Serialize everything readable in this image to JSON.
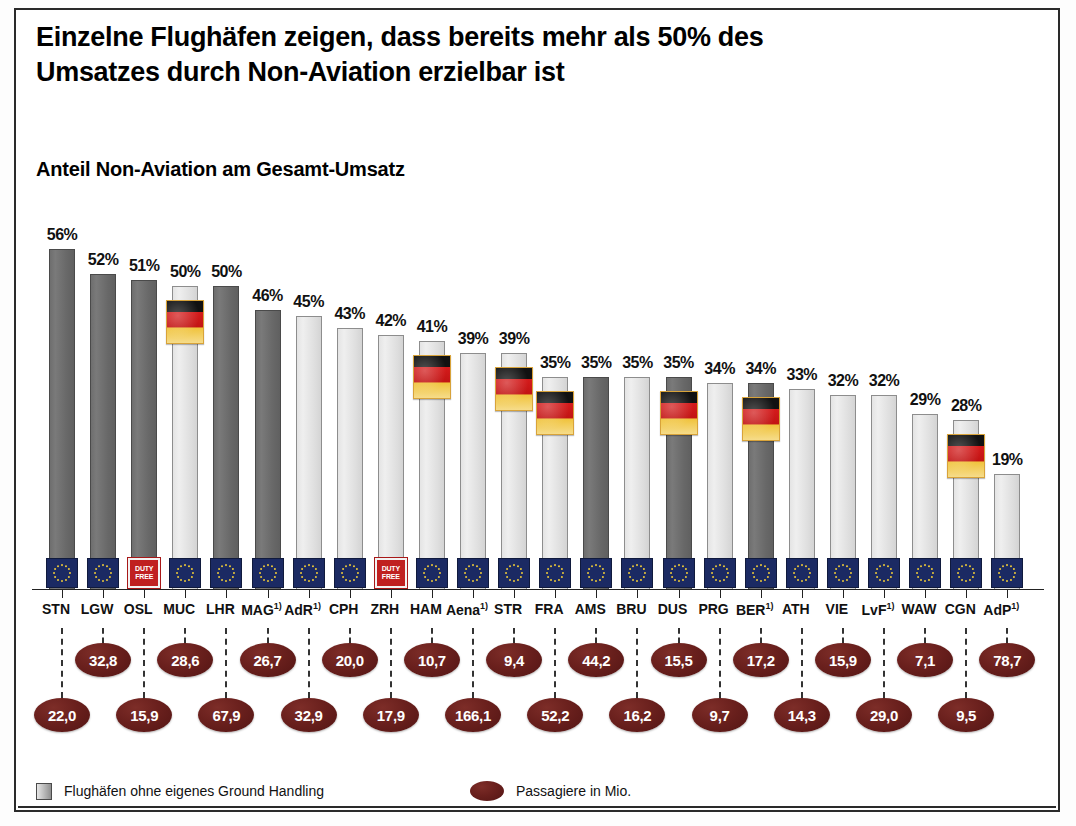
{
  "title": "Einzelne Flughäfen zeigen, dass bereits mehr als 50% des\nUmsatzes durch Non-Aviation erzielbar ist",
  "subtitle": "Anteil Non-Aviation am Gesamt-Umsatz",
  "legend": {
    "bar_label": "Flughäfen ohne eigenes Ground Handling",
    "oval_label": "Passagiere in Mio."
  },
  "colors": {
    "bar_dark": "#6e6e6e",
    "bar_light": "#e4e4e4",
    "oval": "#6a201d",
    "eu_badge": "#1b2a63",
    "duty_free_badge": "#c02020",
    "frame": "#2a2a2a"
  },
  "badges": {
    "duty_free_text": "DUTY FREE"
  },
  "chart_data": {
    "type": "bar",
    "title": "Anteil Non-Aviation am Gesamt-Umsatz",
    "xlabel": "",
    "ylabel": "Anteil Non-Aviation am Gesamt-Umsatz (%)",
    "ylim": [
      0,
      60
    ],
    "grid": false,
    "legend_position": "bottom-left",
    "categories": [
      "STN",
      "LGW",
      "OSL",
      "MUC",
      "LHR",
      "MAG",
      "AdR",
      "CPH",
      "ZRH",
      "HAM",
      "Aena",
      "STR",
      "FRA",
      "AMS",
      "BRU",
      "DUS",
      "PRG",
      "BER",
      "ATH",
      "VIE",
      "LvF",
      "WAW",
      "CGN",
      "AdP"
    ],
    "category_footnotes": [
      "",
      "",
      "",
      "",
      "",
      "1)",
      "1)",
      "",
      "",
      "",
      "1)",
      "",
      "",
      "",
      "",
      "",
      "",
      "1)",
      "",
      "",
      "1)",
      "",
      "",
      "1)"
    ],
    "values": [
      56,
      52,
      51,
      50,
      50,
      46,
      45,
      43,
      42,
      41,
      39,
      39,
      35,
      35,
      35,
      35,
      34,
      34,
      33,
      32,
      32,
      29,
      28,
      19
    ],
    "value_labels": [
      "56%",
      "52%",
      "51%",
      "50%",
      "50%",
      "46%",
      "45%",
      "43%",
      "42%",
      "41%",
      "39%",
      "39%",
      "35%",
      "35%",
      "35%",
      "35%",
      "34%",
      "34%",
      "33%",
      "32%",
      "32%",
      "29%",
      "28%",
      "19%"
    ],
    "series": [
      {
        "name": "Anteil Non-Aviation am Gesamt-Umsatz",
        "values": [
          56,
          52,
          51,
          50,
          50,
          46,
          45,
          43,
          42,
          41,
          39,
          39,
          35,
          35,
          35,
          35,
          34,
          34,
          33,
          32,
          32,
          29,
          28,
          19
        ]
      },
      {
        "name": "Passagiere in Mio.",
        "values": [
          22.0,
          32.8,
          15.9,
          28.6,
          67.9,
          26.7,
          32.9,
          20.0,
          17.9,
          10.7,
          166.1,
          9.4,
          52.2,
          44.2,
          16.2,
          15.5,
          9.7,
          17.2,
          14.3,
          15.9,
          29.0,
          7.1,
          9.5,
          78.7
        ]
      }
    ],
    "pax_labels": [
      "22,0",
      "32,8",
      "15,9",
      "28,6",
      "67,9",
      "26,7",
      "32,9",
      "20,0",
      "17,9",
      "10,7",
      "166,1",
      "9,4",
      "52,2",
      "44,2",
      "16,2",
      "15,5",
      "9,7",
      "17,2",
      "14,3",
      "15,9",
      "29,0",
      "7,1",
      "9,5",
      "78,7"
    ],
    "pax_row": [
      "lower",
      "upper",
      "lower",
      "upper",
      "lower",
      "upper",
      "lower",
      "upper",
      "lower",
      "upper",
      "lower",
      "upper",
      "lower",
      "upper",
      "lower",
      "upper",
      "lower",
      "upper",
      "lower",
      "upper",
      "lower",
      "upper",
      "lower",
      "upper"
    ],
    "bar_style": [
      "dark",
      "dark",
      "dark",
      "light",
      "dark",
      "dark",
      "light",
      "light",
      "light",
      "light",
      "light",
      "light",
      "light",
      "dark",
      "light",
      "dark",
      "light",
      "dark",
      "light",
      "light",
      "light",
      "light",
      "light",
      "light"
    ],
    "foot_badge": [
      "eu",
      "eu",
      "duty",
      "eu",
      "eu",
      "eu",
      "eu",
      "eu",
      "duty",
      "eu",
      "eu",
      "eu",
      "eu",
      "eu",
      "eu",
      "eu",
      "eu",
      "eu",
      "eu",
      "eu",
      "eu",
      "eu",
      "eu",
      "eu"
    ],
    "german_flag": [
      false,
      false,
      false,
      true,
      false,
      false,
      false,
      false,
      false,
      true,
      false,
      true,
      true,
      false,
      false,
      true,
      false,
      true,
      false,
      false,
      false,
      false,
      true,
      false
    ],
    "annotations": [
      "Dunkelgraue Balken: Flughäfen ohne eigenes Ground Handling",
      "Deutschlandfahne markiert deutsche Flughäfen",
      "Ovale Zahlen: Passagiere in Mio."
    ]
  }
}
